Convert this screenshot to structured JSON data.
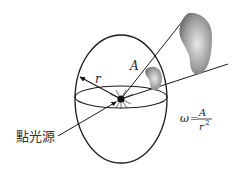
{
  "diagram": {
    "labels": {
      "radius": "r",
      "area": "A",
      "point_source": "點光源"
    },
    "formula": {
      "lhs": "ω",
      "equals": "=",
      "numerator": "A",
      "denominator": "r",
      "exponent": "2"
    },
    "colors": {
      "stroke": "#1a1a1a",
      "blob_fill_light": "#e6e6e6",
      "blob_fill_dark": "#8a8a8a",
      "background": "#ffffff"
    }
  }
}
